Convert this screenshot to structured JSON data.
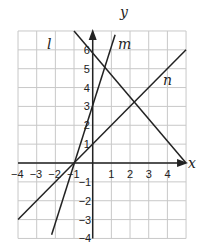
{
  "chart_data": {
    "type": "line",
    "title": "",
    "xlabel": "x",
    "ylabel": "y",
    "xlim": [
      -4,
      5
    ],
    "ylim": [
      -4,
      7
    ],
    "grid": true,
    "x_ticks": [
      "-4",
      "-3",
      "-2",
      "-1",
      "1",
      "2",
      "3",
      "4"
    ],
    "y_ticks": [
      "6",
      "5",
      "4",
      "3",
      "2",
      "1",
      "-1",
      "-2",
      "-3",
      "-4"
    ],
    "series": [
      {
        "name": "l",
        "points": [
          [
            -1,
            7
          ],
          [
            5,
            0
          ]
        ],
        "equation": "y = -x + 5"
      },
      {
        "name": "m",
        "points": [
          [
            -2.2,
            -3.8
          ],
          [
            1.2,
            6.8
          ]
        ],
        "equation": "y = 3x + 3"
      },
      {
        "name": "n",
        "points": [
          [
            -4,
            -3
          ],
          [
            5,
            6
          ]
        ],
        "equation": "y = x + 1"
      }
    ],
    "annotations": [
      "l",
      "m",
      "n"
    ]
  },
  "labels": {
    "x_axis": "x",
    "y_axis": "y",
    "line_l": "l",
    "line_m": "m",
    "line_n": "n"
  }
}
